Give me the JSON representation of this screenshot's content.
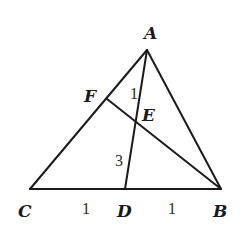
{
  "diagram": {
    "type": "geometry-triangle",
    "points": {
      "A": {
        "label": "A",
        "x": 147,
        "y": 50
      },
      "B": {
        "label": "B",
        "x": 221,
        "y": 189
      },
      "C": {
        "label": "C",
        "x": 30,
        "y": 189
      },
      "D": {
        "label": "D",
        "x": 125,
        "y": 189
      },
      "E": {
        "label": "E",
        "x": 136,
        "y": 122
      },
      "F": {
        "label": "F",
        "x": 107,
        "y": 99
      }
    },
    "segments": [
      {
        "name": "AC",
        "from": "A",
        "to": "C"
      },
      {
        "name": "AB",
        "from": "A",
        "to": "B"
      },
      {
        "name": "CB",
        "from": "C",
        "to": "B"
      },
      {
        "name": "AD",
        "from": "A",
        "to": "D"
      },
      {
        "name": "FB",
        "from": "F",
        "to": "B"
      }
    ],
    "annotations": {
      "angle_1": "1",
      "segment_ED": "3",
      "segment_CD": "1",
      "segment_DB": "1"
    },
    "labels": {
      "A": "A",
      "B": "B",
      "C": "C",
      "D": "D",
      "E": "E",
      "F": "F"
    },
    "colors": {
      "stroke": "#1a1a1a",
      "background": "#ffffff"
    }
  }
}
